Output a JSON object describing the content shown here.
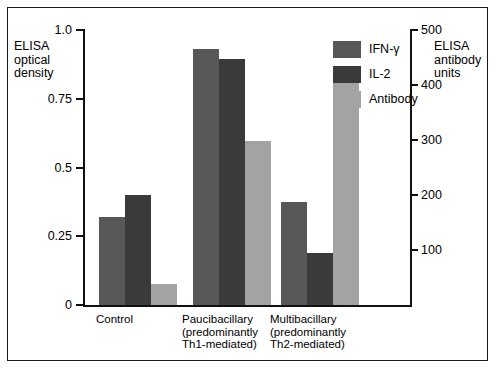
{
  "chart_data": {
    "type": "bar",
    "title": "",
    "categories": [
      "Control",
      "Paucibacillary\n(predominantly\nTh1-mediated)",
      "Multibacillary\n(predominantly\nTh2-mediated)"
    ],
    "series": [
      {
        "name": "IFN-γ",
        "color": "#585858",
        "axis": "left",
        "values": [
          0.32,
          0.93,
          0.375
        ]
      },
      {
        "name": "IL-2",
        "color": "#3a3a3a",
        "axis": "left",
        "values": [
          0.4,
          0.895,
          0.19
        ]
      },
      {
        "name": "Antibody",
        "color": "#a3a3a3",
        "axis": "right",
        "values": [
          0.075,
          0.595,
          0.81
        ]
      }
    ],
    "antibody_units_values": [
      40,
      300,
      405
    ],
    "ylabel": "ELISA\noptical\ndensity",
    "ylabel_right": "ELISA\nantibody\nunits",
    "xlabel": "",
    "ylim": [
      0,
      1.0
    ],
    "ylim_right": [
      0,
      500
    ],
    "yticks": [
      "0",
      "0.25",
      "0.5",
      "0.75",
      "1.0"
    ],
    "ytick_values": [
      0,
      0.25,
      0.5,
      0.75,
      1.0
    ],
    "yticks_right": [
      "100",
      "200",
      "300",
      "400",
      "500"
    ],
    "ytick_values_right": [
      100,
      200,
      300,
      400,
      500
    ],
    "grid": false,
    "legend_position": "upper right",
    "legend": [
      "IFN-γ",
      "IL-2",
      "Antibody"
    ]
  }
}
